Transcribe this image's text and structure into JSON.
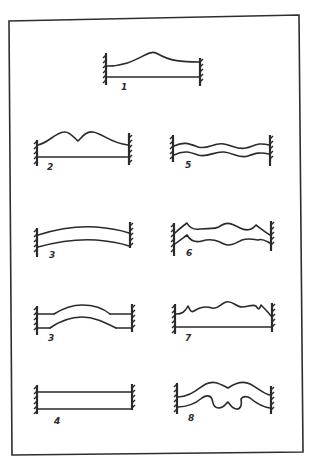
{
  "diagram": {
    "type": "hand-drawn mode-shape sketches of beams fixed at both ends",
    "figures": [
      {
        "id": "fig-1",
        "label": "1",
        "description": "single central hump on upper edge, straight lower edge"
      },
      {
        "id": "fig-2",
        "label": "2",
        "description": "double hump on upper edge, straight lower edge"
      },
      {
        "id": "fig-5",
        "label": "5",
        "description": "two parallel sinusoidal wavy lines"
      },
      {
        "id": "fig-3a",
        "label": "3",
        "description": "uniformly bowed beam, both edges arched upward"
      },
      {
        "id": "fig-6",
        "label": "6",
        "description": "two parallel wavy lines with cusps"
      },
      {
        "id": "fig-3b",
        "label": "3",
        "description": "beam with raised central section (bump) in both edges"
      },
      {
        "id": "fig-7",
        "label": "7",
        "description": "irregular wavy upper edge with cusps, straight lower edge"
      },
      {
        "id": "fig-4",
        "label": "4",
        "description": "straight rectangular beam between two walls"
      },
      {
        "id": "fig-8",
        "label": "8",
        "description": "mustache-shaped beam with double lobed underside"
      }
    ]
  },
  "colors": {
    "ink": "#2a2a2a",
    "paper": "#ffffff"
  }
}
